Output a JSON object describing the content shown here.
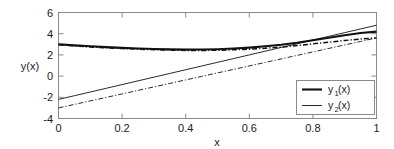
{
  "chart_data": {
    "type": "line",
    "title": "",
    "xlabel": "x",
    "ylabel": "y(x)",
    "xlim": [
      0,
      1
    ],
    "ylim": [
      -4,
      6
    ],
    "grid": false,
    "legend_position": "lower right",
    "x_ticks": [
      "0",
      "0.2",
      "0.4",
      "0.6",
      "0.8",
      "1"
    ],
    "x_tick_values": [
      0,
      0.2,
      0.4,
      0.6,
      0.8,
      1
    ],
    "y_ticks": [
      "-4",
      "-2",
      "0",
      "2",
      "4",
      "6"
    ],
    "y_tick_values": [
      -4,
      -2,
      0,
      2,
      4,
      6
    ],
    "x": [
      0,
      0.05,
      0.1,
      0.15,
      0.2,
      0.25,
      0.3,
      0.35,
      0.4,
      0.45,
      0.5,
      0.55,
      0.6,
      0.65,
      0.7,
      0.75,
      0.8,
      0.85,
      0.9,
      0.95,
      1
    ],
    "series": [
      {
        "name": "y1(x) curve",
        "style": "solid-thick",
        "values": [
          3.0,
          2.9,
          2.81,
          2.73,
          2.66,
          2.6,
          2.55,
          2.52,
          2.5,
          2.51,
          2.54,
          2.6,
          2.69,
          2.81,
          2.96,
          3.15,
          3.38,
          3.62,
          3.86,
          4.06,
          4.2
        ]
      },
      {
        "name": "y2(x) curve",
        "style": "dashdot-thick",
        "values": [
          2.95,
          2.85,
          2.75,
          2.67,
          2.6,
          2.54,
          2.49,
          2.45,
          2.42,
          2.42,
          2.44,
          2.48,
          2.54,
          2.63,
          2.74,
          2.88,
          3.04,
          3.2,
          3.36,
          3.5,
          3.6
        ]
      },
      {
        "name": "y1(x) line",
        "style": "solid-thin",
        "values": [
          -2.2,
          -1.85,
          -1.5,
          -1.15,
          -0.8,
          -0.45,
          -0.1,
          0.25,
          0.6,
          0.95,
          1.3,
          1.65,
          2.0,
          2.35,
          2.7,
          3.05,
          3.4,
          3.75,
          4.1,
          4.45,
          4.8
        ]
      },
      {
        "name": "y2(x) line",
        "style": "dashdot-thin",
        "values": [
          -3.0,
          -2.67,
          -2.34,
          -2.01,
          -1.68,
          -1.35,
          -1.02,
          -0.69,
          -0.36,
          -0.03,
          0.3,
          0.63,
          0.96,
          1.29,
          1.62,
          1.95,
          2.28,
          2.61,
          2.94,
          3.27,
          3.6
        ]
      }
    ],
    "legend": [
      {
        "base": "y",
        "sub": "1",
        "suffix": "(x)",
        "style": "solid-thick"
      },
      {
        "base": "y",
        "sub": "2",
        "suffix": "(x)",
        "style": "solid-thin"
      }
    ]
  },
  "colors": {
    "background": "#ffffff",
    "axis": "#8a8a8a",
    "curve": "#111111",
    "text": "#1a1a1a"
  }
}
